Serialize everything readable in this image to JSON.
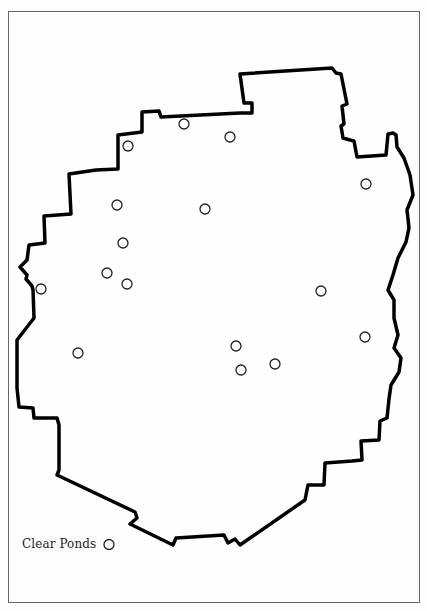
{
  "map": {
    "boundary_color": "#000000",
    "boundary_width": 3.5,
    "boundary_points": [
      [
        240,
        74
      ],
      [
        332,
        68
      ],
      [
        336,
        73
      ],
      [
        341,
        74
      ],
      [
        347,
        104
      ],
      [
        342,
        106
      ],
      [
        344,
        124
      ],
      [
        341,
        126
      ],
      [
        343,
        138
      ],
      [
        350,
        140
      ],
      [
        354,
        141
      ],
      [
        357,
        157
      ],
      [
        386,
        155
      ],
      [
        388,
        134
      ],
      [
        393,
        133
      ],
      [
        396,
        135
      ],
      [
        397,
        147
      ],
      [
        404,
        158
      ],
      [
        410,
        175
      ],
      [
        413,
        195
      ],
      [
        407,
        210
      ],
      [
        409,
        228
      ],
      [
        406,
        242
      ],
      [
        398,
        258
      ],
      [
        393,
        275
      ],
      [
        388,
        290
      ],
      [
        394,
        300
      ],
      [
        394,
        318
      ],
      [
        398,
        335
      ],
      [
        394,
        348
      ],
      [
        401,
        358
      ],
      [
        399,
        372
      ],
      [
        391,
        385
      ],
      [
        389,
        399
      ],
      [
        387,
        418
      ],
      [
        380,
        421
      ],
      [
        379,
        440
      ],
      [
        361,
        441
      ],
      [
        362,
        460
      ],
      [
        352,
        461
      ],
      [
        325,
        463
      ],
      [
        324,
        485
      ],
      [
        308,
        485
      ],
      [
        305,
        500
      ],
      [
        240,
        545
      ],
      [
        235,
        539
      ],
      [
        228,
        543
      ],
      [
        224,
        535
      ],
      [
        176,
        538
      ],
      [
        173,
        545
      ],
      [
        130,
        524
      ],
      [
        137,
        518
      ],
      [
        135,
        512
      ],
      [
        57,
        475
      ],
      [
        59,
        470
      ],
      [
        59,
        425
      ],
      [
        57,
        418
      ],
      [
        34,
        418
      ],
      [
        33,
        408
      ],
      [
        19,
        407
      ],
      [
        17,
        388
      ],
      [
        17,
        340
      ],
      [
        34,
        318
      ],
      [
        33,
        290
      ],
      [
        32,
        286
      ],
      [
        26,
        279
      ],
      [
        27,
        275
      ],
      [
        20,
        267
      ],
      [
        27,
        260
      ],
      [
        29,
        245
      ],
      [
        45,
        243
      ],
      [
        44,
        216
      ],
      [
        71,
        214
      ],
      [
        69,
        174
      ],
      [
        96,
        170
      ],
      [
        118,
        169
      ],
      [
        118,
        135
      ],
      [
        142,
        132
      ],
      [
        142,
        112
      ],
      [
        159,
        111
      ],
      [
        161,
        117
      ],
      [
        240,
        113
      ],
      [
        252,
        113
      ],
      [
        252,
        103
      ],
      [
        244,
        103
      ]
    ],
    "pond_radius": 5,
    "pond_color": "#222222",
    "ponds": [
      {
        "x": 184,
        "y": 124
      },
      {
        "x": 128,
        "y": 146
      },
      {
        "x": 230,
        "y": 137
      },
      {
        "x": 366,
        "y": 184
      },
      {
        "x": 117,
        "y": 205
      },
      {
        "x": 205,
        "y": 209
      },
      {
        "x": 123,
        "y": 243
      },
      {
        "x": 107,
        "y": 273
      },
      {
        "x": 127,
        "y": 284
      },
      {
        "x": 41,
        "y": 289
      },
      {
        "x": 321,
        "y": 291
      },
      {
        "x": 365,
        "y": 337
      },
      {
        "x": 78,
        "y": 353
      },
      {
        "x": 236,
        "y": 346
      },
      {
        "x": 275,
        "y": 364
      },
      {
        "x": 241,
        "y": 370
      }
    ]
  },
  "legend": {
    "label": "Clear Ponds",
    "symbol": "hollow-circle"
  }
}
